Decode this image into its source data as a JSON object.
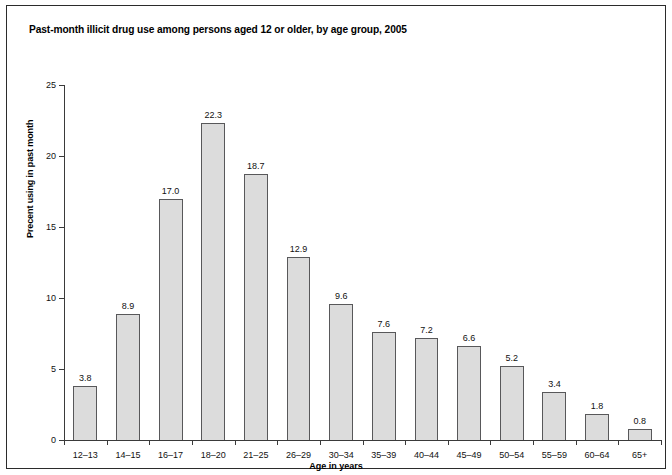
{
  "chart_data": {
    "type": "bar",
    "title": "Past-month illicit drug use among persons aged 12 or older, by age group, 2005",
    "xlabel": "Age in years",
    "ylabel": "Precent using in past month",
    "ylim": [
      0,
      25
    ],
    "yticks": [
      0,
      5,
      10,
      15,
      20,
      25
    ],
    "grid": false,
    "legend": false,
    "categories": [
      "12–13",
      "14–15",
      "16–17",
      "18–20",
      "21–25",
      "26–29",
      "30–34",
      "35–39",
      "40–44",
      "45–49",
      "50–54",
      "55–59",
      "60–64",
      "65+"
    ],
    "values": [
      3.8,
      8.9,
      17.0,
      22.3,
      18.7,
      12.9,
      9.6,
      7.6,
      7.2,
      6.6,
      5.2,
      3.4,
      1.8,
      0.8
    ],
    "value_labels": [
      "3.8",
      "8.9",
      "17.0",
      "22.3",
      "18.7",
      "12.9",
      "9.6",
      "7.6",
      "7.2",
      "6.6",
      "5.2",
      "3.4",
      "1.8",
      "0.8"
    ],
    "bar_fill_color": "#dcdcdc",
    "bar_border_color": "#58585a",
    "axis_color": "#3a3a3a",
    "background_color": "#ffffff"
  }
}
